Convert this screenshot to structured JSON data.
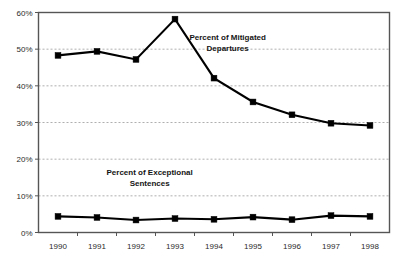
{
  "chart_data": {
    "type": "line",
    "title": "",
    "subtitle": "",
    "xlabel": "",
    "ylabel": "",
    "categories": [
      "1990",
      "1991",
      "1992",
      "1993",
      "1994",
      "1995",
      "1996",
      "1997",
      "1998"
    ],
    "x": [
      1990,
      1991,
      1992,
      1993,
      1994,
      1995,
      1996,
      1997,
      1998
    ],
    "ylim": [
      0,
      60
    ],
    "xlim": [
      1989.5,
      1998.5
    ],
    "y_ticks": [
      0,
      10,
      20,
      30,
      40,
      50,
      60
    ],
    "y_tick_labels": [
      "0%",
      "10%",
      "20%",
      "30%",
      "40%",
      "50%",
      "60%"
    ],
    "x_tick_labels": [
      "1990",
      "1991",
      "1992",
      "1993",
      "1994",
      "1995",
      "1996",
      "1997",
      "1998"
    ],
    "grid": true,
    "grid_axis": "y",
    "legend": "none",
    "series": [
      {
        "name": "Percent of Mitigated Departures",
        "color": "#000000",
        "marker": "square",
        "values": [
          48.3,
          49.4,
          47.2,
          58.2,
          42.1,
          35.6,
          32.1,
          29.8,
          29.2
        ]
      },
      {
        "name": "Percent of Exceptional Sentences",
        "color": "#000000",
        "marker": "square",
        "values": [
          4.4,
          4.1,
          3.4,
          3.8,
          3.6,
          4.2,
          3.5,
          4.6,
          4.4
        ]
      }
    ],
    "annotations": [
      {
        "id": "mitigated-departures-label",
        "lines": [
          "Percent of Mitigated",
          "Departures"
        ],
        "x": 1994.35,
        "y": 52.5
      },
      {
        "id": "exceptional-sentences-label",
        "lines": [
          "Percent of Exceptional",
          "Sentences"
        ],
        "x": 1992.35,
        "y": 15.8
      }
    ]
  }
}
